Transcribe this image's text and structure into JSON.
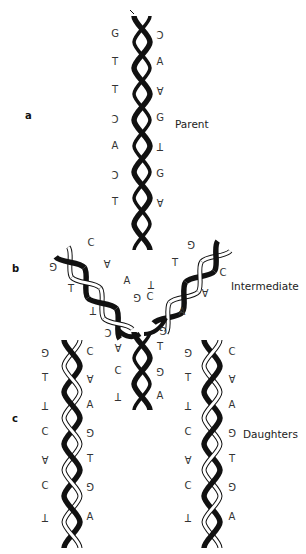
{
  "figure": {
    "panels": [
      {
        "letter": "a",
        "label": "Parent"
      },
      {
        "letter": "b",
        "label": "Intermediate"
      },
      {
        "letter": "c",
        "label": "Daughters"
      }
    ],
    "parent": {
      "left_bases": [
        "G",
        "T",
        "T",
        "C",
        "A",
        "C",
        "T"
      ],
      "right_bases": [
        "C",
        "A",
        "A",
        "G",
        "T",
        "G",
        "A"
      ]
    },
    "intermediate": {
      "left_arm_bases": [
        "C",
        "A",
        "G",
        "T",
        "T",
        "A"
      ],
      "right_arm_bases": [
        "G",
        "T",
        "C",
        "A",
        "T",
        "C",
        "G",
        "A"
      ],
      "stem_bases": [
        "C",
        "G",
        "A",
        "T",
        "C",
        "G",
        "T",
        "A"
      ]
    },
    "daughter_left": {
      "left_bases": [
        "G",
        "T",
        "T",
        "C",
        "A",
        "C",
        "T"
      ],
      "right_bases": [
        "C",
        "A",
        "A",
        "G",
        "T",
        "G",
        "A"
      ]
    },
    "daughter_right": {
      "left_bases": [
        "G",
        "T",
        "T",
        "C",
        "A",
        "C",
        "T"
      ],
      "right_bases": [
        "C",
        "A",
        "A",
        "G",
        "T",
        "G",
        "A"
      ]
    },
    "colors": {
      "dark_strand": "#111111",
      "light_strand": "#ffffff",
      "outline": "#111111",
      "text": "#333333"
    }
  }
}
